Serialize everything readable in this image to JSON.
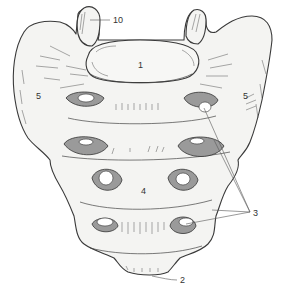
{
  "figure": {
    "background_color": "#ffffff",
    "line_color": "#3a3a3a",
    "fill_color": "#f4f4f2"
  },
  "labels": [
    {
      "id": "1",
      "text": "1",
      "x": 140,
      "y": 67
    },
    {
      "id": "2",
      "text": "2",
      "x": 180,
      "y": 281
    },
    {
      "id": "3",
      "text": "3",
      "x": 253,
      "y": 214
    },
    {
      "id": "4",
      "text": "4",
      "x": 143,
      "y": 193
    },
    {
      "id": "5-left",
      "text": "5",
      "x": 36,
      "y": 99
    },
    {
      "id": "5-right",
      "text": "5",
      "x": 244,
      "y": 99
    },
    {
      "id": "10",
      "text": "10",
      "x": 113,
      "y": 22
    }
  ]
}
